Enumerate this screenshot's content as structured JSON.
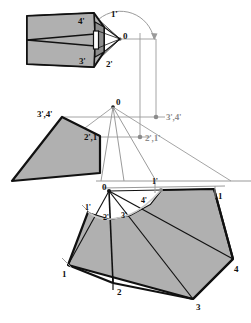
{
  "figure": {
    "type": "engineering-drawing",
    "background_color": "#ffffff",
    "fill_color": "#b0b0b0",
    "fill_color_light": "#c6c6c6",
    "outline_color": "#111111",
    "construction_color": "#9a9a9a",
    "dimensions": {
      "width": 251,
      "height": 323
    }
  },
  "views": {
    "top_view": {
      "name": "top-view-plan",
      "labels": [
        {
          "id": "tv-4p",
          "text": "4'",
          "x": 78,
          "y": 17
        },
        {
          "id": "tv-1p",
          "text": "1'",
          "x": 111,
          "y": 10
        },
        {
          "id": "tv-O",
          "text": "0",
          "x": 123,
          "y": 32
        },
        {
          "id": "tv-3p",
          "text": "3'",
          "x": 79,
          "y": 57
        },
        {
          "id": "tv-2p",
          "text": "2'",
          "x": 106,
          "y": 60
        }
      ],
      "arc": {
        "center_x": 120,
        "center_y": 39,
        "radius": 34,
        "has_arrowhead": true
      }
    },
    "front_view": {
      "name": "front-view-elevation",
      "labels": [
        {
          "id": "fv-O",
          "text": "0",
          "x": 116,
          "y": 98
        },
        {
          "id": "fv-34",
          "text": "3',4'",
          "x": 37,
          "y": 110
        },
        {
          "id": "fv-21",
          "text": "2',1'",
          "x": 84,
          "y": 133
        },
        {
          "id": "fv-34r",
          "text": "3',4'",
          "x": 166,
          "y": 113,
          "grayed": true
        },
        {
          "id": "fv-21r",
          "text": "2',1'",
          "x": 145,
          "y": 134,
          "grayed": true
        }
      ]
    },
    "development": {
      "name": "development-unfolded-surface",
      "labels": [
        {
          "id": "dv-O",
          "text": "0",
          "x": 102,
          "y": 183
        },
        {
          "id": "dv-1pt",
          "text": "1'",
          "x": 152,
          "y": 181
        },
        {
          "id": "dv-1r",
          "text": "1",
          "x": 218,
          "y": 192
        },
        {
          "id": "dv-1pl",
          "text": "1'",
          "x": 85,
          "y": 206
        },
        {
          "id": "dv-2p",
          "text": "2'",
          "x": 103,
          "y": 215
        },
        {
          "id": "dv-3p",
          "text": "3'",
          "x": 121,
          "y": 213
        },
        {
          "id": "dv-4p",
          "text": "4'",
          "x": 141,
          "y": 199
        },
        {
          "id": "dv-1",
          "text": "1",
          "x": 62,
          "y": 272
        },
        {
          "id": "dv-2",
          "text": "2",
          "x": 117,
          "y": 288
        },
        {
          "id": "dv-3",
          "text": "3",
          "x": 196,
          "y": 305
        },
        {
          "id": "dv-4",
          "text": "4",
          "x": 234,
          "y": 268
        }
      ]
    }
  }
}
